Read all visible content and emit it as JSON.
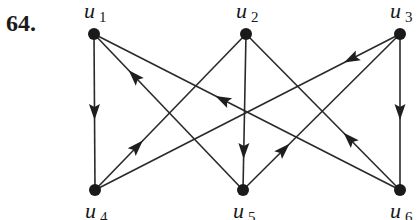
{
  "problem": {
    "number": "64."
  },
  "graph": {
    "directed": true,
    "nodes": [
      {
        "id": "u1",
        "label": "u",
        "sub": "1",
        "x": 94,
        "y": 34
      },
      {
        "id": "u2",
        "label": "u",
        "sub": "2",
        "x": 246,
        "y": 34
      },
      {
        "id": "u3",
        "label": "u",
        "sub": "3",
        "x": 400,
        "y": 34
      },
      {
        "id": "u4",
        "label": "u",
        "sub": "4",
        "x": 95,
        "y": 190
      },
      {
        "id": "u5",
        "label": "u",
        "sub": "5",
        "x": 243,
        "y": 190
      },
      {
        "id": "u6",
        "label": "u",
        "sub": "6",
        "x": 400,
        "y": 190
      }
    ],
    "edges": [
      {
        "from": "u1",
        "to": "u4",
        "arrow_at": 0.5
      },
      {
        "from": "u5",
        "to": "u1",
        "arrow_at": 0.73
      },
      {
        "from": "u6",
        "to": "u1",
        "arrow_at": 0.58
      },
      {
        "from": "u4",
        "to": "u2",
        "arrow_at": 0.28
      },
      {
        "from": "u2",
        "to": "u5",
        "arrow_at": 0.75
      },
      {
        "from": "u6",
        "to": "u2",
        "arrow_at": 0.33
      },
      {
        "from": "u3",
        "to": "u4",
        "arrow_at": 0.16
      },
      {
        "from": "u5",
        "to": "u3",
        "arrow_at": 0.26
      },
      {
        "from": "u3",
        "to": "u6",
        "arrow_at": 0.5
      }
    ]
  },
  "colors": {
    "ink": "#1a1a1a",
    "background": "#ffffff"
  }
}
